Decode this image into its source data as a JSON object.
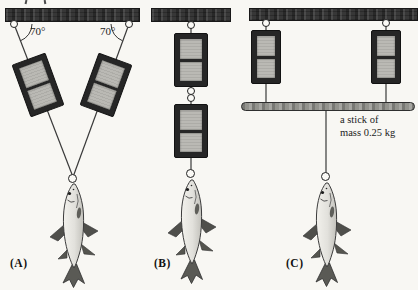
{
  "panels": [
    {
      "label": "(A)",
      "angle_left": "70°",
      "angle_right": "70°"
    },
    {
      "label": "(B)"
    },
    {
      "label": "(C)",
      "stick_caption": [
        "a stick of",
        "mass 0.25 kg"
      ]
    }
  ],
  "colors": {
    "background": "#f8f7f3",
    "ink": "#1c1c1c",
    "ceiling_bar": "#373737",
    "scale_body": "#262626",
    "scale_panel": "#bab9b4",
    "stick": "#93938d",
    "string": "#3a3a3a",
    "fish_body": "#ececе8",
    "fish_fins": "#4f4f4b"
  }
}
